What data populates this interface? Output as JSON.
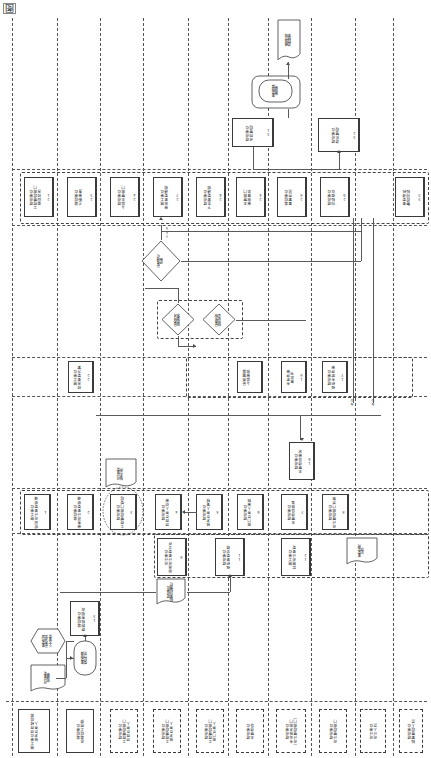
{
  "page": {
    "title": "图",
    "orientation": "rotated-90",
    "note": "纵向泳道业务流程图"
  },
  "edge_labels": {
    "yes": "YES",
    "no": "NO",
    "no2": "NO",
    "no3": "NO"
  },
  "legend": {
    "band_label": "岗位／部门",
    "cells": [
      {
        "id": "l1",
        "text": "施工单位项目经理部\n技术负责人",
        "style": "solid"
      },
      {
        "id": "l2",
        "text": "监理单位\n总监理工程师",
        "style": "solid"
      },
      {
        "id": "l3",
        "text": "建设单位\n工程管理部门\n项目负责人",
        "style": "dash"
      },
      {
        "id": "l4",
        "text": "建设单位\n工程管理部门\n技术负责人",
        "style": "dash"
      },
      {
        "id": "l5",
        "text": "建设单位\n工程管理部门\n部门负责人",
        "style": "dash"
      },
      {
        "id": "l6",
        "text": "建设单位\n主管领导",
        "style": "dash"
      },
      {
        "id": "l7",
        "text": "建设单位\n专业技术部门\n（设计管理部门）",
        "style": "dash"
      },
      {
        "id": "l8",
        "text": "建设单位\n设计管理部门",
        "style": "dash"
      },
      {
        "id": "l9",
        "text": "设计单位\n设计人员",
        "style": "dash"
      },
      {
        "id": "l10",
        "text": "建设单位\n档案管理人员",
        "style": "dash"
      }
    ]
  },
  "nodes": [
    {
      "id": "n1",
      "num": "1",
      "text": "施工单位\n提出设计变更申请",
      "shape": "process"
    },
    {
      "id": "n2",
      "num": "",
      "text": "设计变更\n申请单",
      "shape": "document"
    },
    {
      "id": "n3",
      "num": "",
      "text": "变更内容\n是否涉及\n重大变更",
      "shape": "hexagon"
    },
    {
      "id": "n4",
      "num": "",
      "text": "变更申请\n受理登记",
      "shape": "rounded"
    },
    {
      "id": "n5",
      "num": "2",
      "text": "监理单位\n审查设计变更申请",
      "shape": "process"
    },
    {
      "id": "n6",
      "num": "3",
      "text": "建设单位\n工程管理部门受理",
      "shape": "process"
    },
    {
      "id": "n7",
      "num": "4",
      "text": "建设单位\n项目负责人初审",
      "shape": "process"
    },
    {
      "id": "n8",
      "num": "5",
      "text": "建设单位\n技术负责人复核",
      "shape": "process"
    },
    {
      "id": "n9",
      "num": "6",
      "text": "建设单位\n部门负责人审核",
      "shape": "process"
    },
    {
      "id": "n10",
      "num": "7",
      "text": "建设单位\n主管领导批准",
      "shape": "process"
    },
    {
      "id": "n11",
      "num": "8",
      "text": "建设单位\n设计管理部门会签",
      "shape": "process"
    },
    {
      "id": "n12",
      "num": "9",
      "text": "设计单位\n出具设计变更文件",
      "shape": "process"
    },
    {
      "id": "n13",
      "num": "10",
      "text": "设计变更\n技术文件",
      "shape": "document"
    },
    {
      "id": "n14",
      "num": "11",
      "text": "建设单位\n组织变更交底",
      "shape": "process"
    },
    {
      "id": "n15",
      "num": "12",
      "text": "施工单位\n实施设计变更",
      "shape": "process"
    },
    {
      "id": "n16",
      "num": "13",
      "text": "监理单位\n跟踪检查验收",
      "shape": "process"
    },
    {
      "id": "n17",
      "num": "14",
      "text": "变更实施\n记录",
      "shape": "document"
    },
    {
      "id": "n18",
      "num": "15",
      "text": "建设单位\n档案归档管理",
      "shape": "process"
    },
    {
      "id": "n19",
      "num": "16",
      "text": "重大设计变更\n专项论证",
      "shape": "process"
    },
    {
      "id": "n20",
      "num": "17",
      "text": "建设单位\n组织专家评审",
      "shape": "process"
    },
    {
      "id": "n21",
      "num": "18",
      "text": "专家评审\n意见书",
      "shape": "document"
    },
    {
      "id": "n22",
      "num": "19",
      "text": "建设单位\n主管领导审定",
      "shape": "process"
    },
    {
      "id": "n23",
      "num": "20",
      "text": "是否通过\n评审",
      "shape": "ellipse"
    },
    {
      "id": "n24",
      "num": "21",
      "text": "建设单位\n工程管理部门\n退回修改",
      "shape": "process"
    },
    {
      "id": "n25",
      "num": "22",
      "text": "施工单位\n修改变更方案",
      "shape": "process"
    },
    {
      "id": "n26",
      "num": "23",
      "text": "监理单位\n重新审查",
      "shape": "process"
    },
    {
      "id": "n27",
      "num": "",
      "text": "是否符合\n规范要求",
      "shape": "diamond"
    },
    {
      "id": "n28",
      "num": "",
      "text": "是否影响\n结构安全",
      "shape": "diamond"
    },
    {
      "id": "n29",
      "num": "",
      "text": "是否需要\n上报审批",
      "shape": "diamond"
    },
    {
      "id": "n30",
      "num": "24",
      "text": "建设单位\n上报主管部门",
      "shape": "process"
    },
    {
      "id": "n31",
      "num": "25",
      "text": "主管部门\n审批意见",
      "shape": "process"
    },
    {
      "id": "n32",
      "num": "26",
      "text": "建设单位\n下发变更通知",
      "shape": "process"
    },
    {
      "id": "n33",
      "num": "27",
      "text": "施工单位\n接收变更通知",
      "shape": "process"
    },
    {
      "id": "n34",
      "num": "28",
      "text": "监理单位\n备案登记",
      "shape": "process"
    },
    {
      "id": "n35",
      "num": "29",
      "text": "建设单位\n归档保存",
      "shape": "process"
    },
    {
      "id": "n36",
      "num": "30",
      "text": "变更费用\n结算审核",
      "shape": "process"
    },
    {
      "id": "n37",
      "num": "",
      "text": "变更结算\n审批单",
      "shape": "document"
    },
    {
      "id": "n38",
      "num": "",
      "text": "审批完成\n流程结束",
      "shape": "terminator"
    },
    {
      "id": "n39",
      "num": "31",
      "text": "建设单位\n合同管理",
      "shape": "process"
    },
    {
      "id": "n40",
      "num": "32",
      "text": "建设单位\n造价管理",
      "shape": "process"
    },
    {
      "id": "n41",
      "num": "33",
      "text": "变更资料\n整理归档",
      "shape": "process"
    }
  ]
}
